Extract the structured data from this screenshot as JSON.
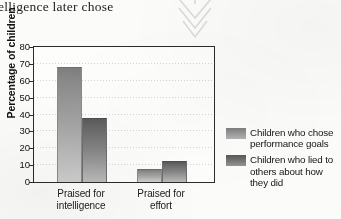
{
  "page": {
    "background_color": "#fbfbfa",
    "body_text_fragment": "elligence later chose"
  },
  "arrow": {
    "icon": "double-chevron-down-icon",
    "color": "#dcdcdc",
    "direction": "down"
  },
  "chart_data": {
    "type": "bar",
    "title": "",
    "xlabel": "",
    "ylabel": "Percentage of children",
    "categories": [
      "Praised for intelligence",
      "Praised for effort"
    ],
    "series": [
      {
        "name": "Children who chose performance goals",
        "values": [
          68,
          8
        ],
        "color": "#9a9a9a"
      },
      {
        "name": "Children who lied to others about how they did",
        "values": [
          38,
          12.5
        ],
        "color": "#6e6e6e"
      }
    ],
    "ylim": [
      0,
      80
    ],
    "yticks": [
      0,
      10,
      20,
      30,
      40,
      50,
      60,
      70,
      80
    ],
    "ytick_labels": [
      "0",
      "10",
      "20",
      "30",
      "40",
      "50",
      "60",
      "70",
      "80"
    ],
    "grid": true,
    "grid_axis": "y",
    "grid_style": "dotted",
    "legend_position": "right",
    "bar_gradient": true
  },
  "legend": {
    "items": [
      {
        "label": "Children who chose performance goals"
      },
      {
        "label": "Children who lied to others about how they did"
      }
    ]
  },
  "x_labels": [
    {
      "line1": "Praised for",
      "line2": "intelligence"
    },
    {
      "line1": "Praised for",
      "line2": "effort"
    }
  ]
}
